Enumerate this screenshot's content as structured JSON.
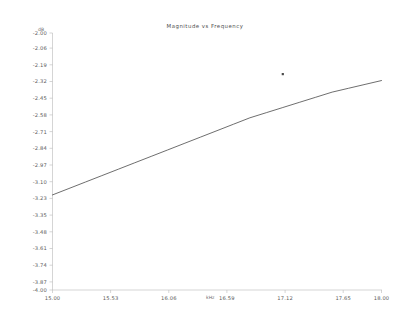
{
  "chart_data": {
    "type": "line",
    "title": "Magnitude vs Frequency",
    "xlabel": "kHz",
    "ylabel": "dB",
    "xlim": [
      15.0,
      18.0
    ],
    "ylim": [
      -4.0,
      -2.0
    ],
    "grid": false,
    "legend": null,
    "x_tick_labels": [
      "15.00",
      "15.53",
      "16.06",
      "16.59",
      "17.12",
      "17.65",
      "18.00"
    ],
    "x_ticks": [
      15.0,
      15.53,
      16.06,
      16.59,
      17.12,
      17.65,
      18.0
    ],
    "y_tick_labels": [
      "-2.00",
      "-2.06",
      "-2.19",
      "-2.32",
      "-2.45",
      "-2.58",
      "-2.71",
      "-2.84",
      "-2.97",
      "-3.10",
      "-3.23",
      "-3.35",
      "-3.48",
      "-3.61",
      "-3.74",
      "-3.87",
      "-4.00"
    ],
    "y_ticks": [
      -2.0,
      -2.06,
      -2.19,
      -2.32,
      -2.45,
      -2.58,
      -2.71,
      -2.84,
      -2.97,
      -3.1,
      -3.23,
      -3.35,
      -3.48,
      -3.61,
      -3.74,
      -3.87,
      -4.0
    ],
    "series": [
      {
        "name": "magnitude",
        "x": [
          15.0,
          15.15,
          15.3,
          15.45,
          15.6,
          15.75,
          15.9,
          16.05,
          16.2,
          16.35,
          16.5,
          16.65,
          16.8,
          16.95,
          17.1,
          17.25,
          17.4,
          17.55,
          17.7,
          17.85,
          18.0
        ],
        "values": [
          -3.26,
          -3.21,
          -3.16,
          -3.11,
          -3.06,
          -3.01,
          -2.96,
          -2.91,
          -2.86,
          -2.81,
          -2.76,
          -2.71,
          -2.66,
          -2.62,
          -2.58,
          -2.54,
          -2.5,
          -2.46,
          -2.43,
          -2.4,
          -2.37
        ]
      }
    ],
    "markers": [
      {
        "name": "isolated-point",
        "x": 17.1,
        "y": -2.32
      }
    ]
  },
  "axis": {
    "y_unit": "dB",
    "x_unit": "kHz"
  }
}
